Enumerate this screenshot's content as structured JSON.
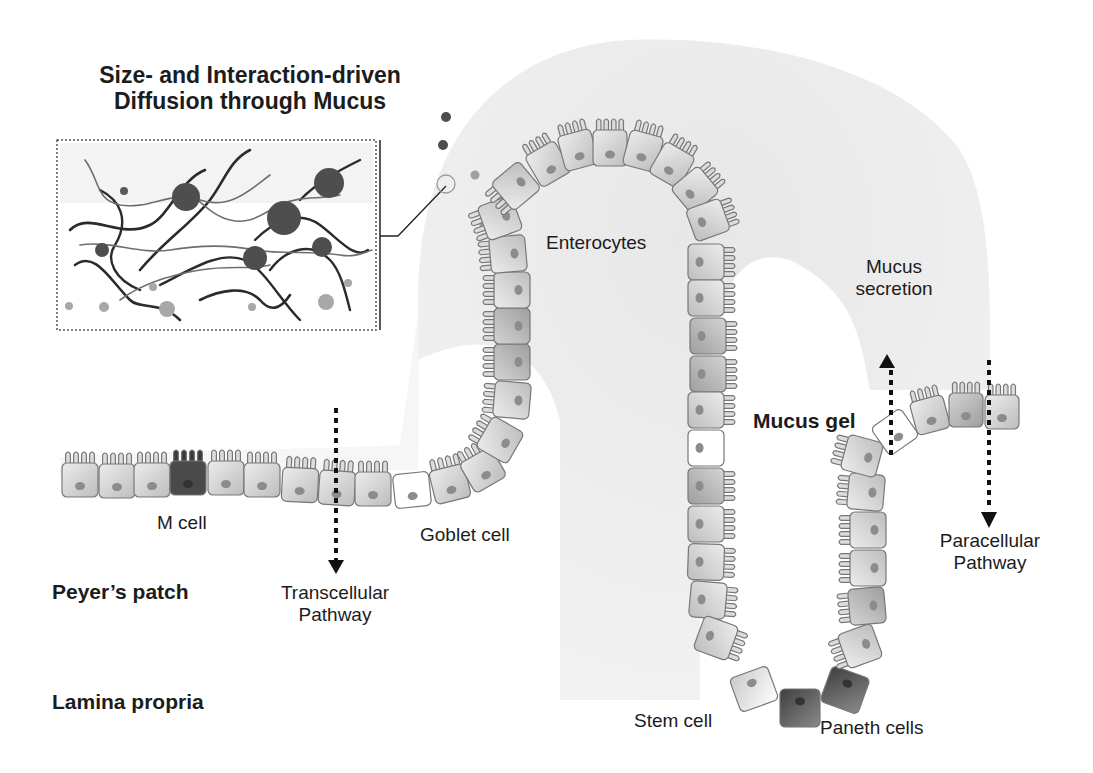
{
  "figure": {
    "title_lines": [
      "Size- and Interaction-driven",
      "Diffusion through Mucus"
    ],
    "labels": {
      "enterocytes": "Enterocytes",
      "mucus_secretion": [
        "Mucus",
        "secretion"
      ],
      "mucus_gel": "Mucus gel",
      "m_cell": "M cell",
      "goblet_cell": "Goblet cell",
      "peyers_patch": "Peyer’s patch",
      "transcellular": [
        "Transcellular",
        "Pathway"
      ],
      "paracellular": [
        "Paracellular",
        "Pathway"
      ],
      "lamina_propria": "Lamina propria",
      "stem_cell": "Stem cell",
      "paneth_cells": "Paneth cells"
    },
    "arrows": [
      {
        "name": "transcellular-arrow",
        "direction": "down"
      },
      {
        "name": "mucus-secretion-arrow",
        "direction": "up"
      },
      {
        "name": "paracellular-arrow",
        "direction": "down"
      }
    ],
    "colors": {
      "mucus_layer": "#ebebeb",
      "cell_fill": "#d6d6d6",
      "cell_fill_dark": "#b9b9b9",
      "cell_outline": "#777777",
      "nucleus": "#8c8c8c",
      "m_cell": "#4a4a4a",
      "paneth": "#5a5a5a",
      "goblet": "#ffffff",
      "particle_large": "#4e4e4e",
      "particle_small": "#a8a8a8",
      "fiber_dark": "#2b2b2b",
      "fiber_light": "#6e6e6e",
      "arrow": "#111111"
    }
  }
}
